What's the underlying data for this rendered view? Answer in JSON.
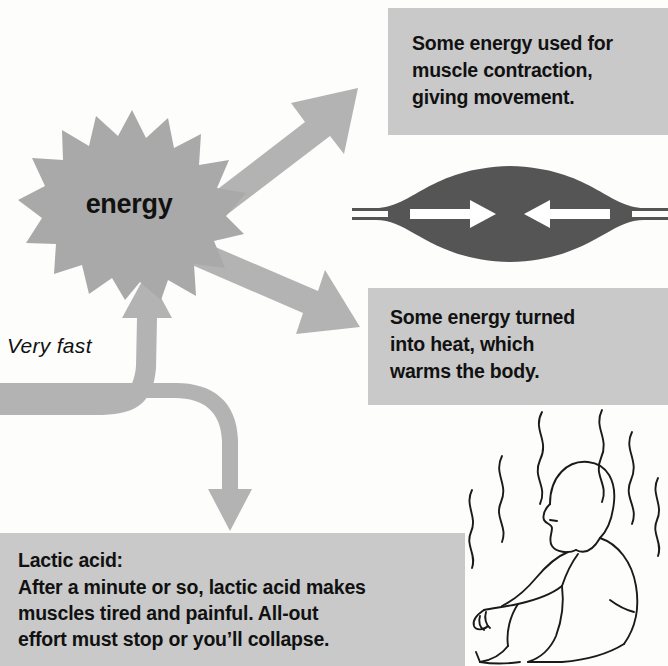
{
  "diagram": {
    "energy_node": {
      "label": "energy",
      "shape": "starburst"
    },
    "flow_label": {
      "text": "Very fast",
      "style": "italic"
    },
    "boxes": [
      {
        "id": "movement",
        "text": "Some energy used for muscle contraction, giving movement.",
        "lines": [
          "Some energy used for",
          "muscle contraction,",
          "giving movement."
        ]
      },
      {
        "id": "heat",
        "text": "Some energy turned into heat, which warms the body.",
        "lines": [
          "Some energy turned",
          "into heat, which",
          "warms the body."
        ]
      },
      {
        "id": "lactic",
        "heading": "Lactic acid:",
        "lines": [
          "After a minute or so, lactic acid makes",
          "muscles tired and painful. All-out",
          "effort must stop or you’ll collapse."
        ]
      }
    ],
    "illustrations": [
      {
        "id": "muscle",
        "caption": "contracting muscle with two inward arrows"
      },
      {
        "id": "tired-person",
        "caption": "seated exhausted person with heat waves"
      }
    ],
    "arrows": [
      {
        "id": "to-movement",
        "direction": "up-right",
        "from": "energy",
        "to": "movement-box"
      },
      {
        "id": "to-heat",
        "direction": "down-right",
        "from": "energy",
        "to": "heat-box"
      },
      {
        "id": "inflow-split",
        "direction": "right-then-split",
        "to": "energy and lactic-box"
      },
      {
        "id": "to-lactic",
        "direction": "down",
        "to": "lactic-box"
      }
    ],
    "colors": {
      "box_fill": "#c9c9c9",
      "burst_fill": "#a9a9a9",
      "arrow_fill": "#b3b3b3",
      "muscle_fill": "#555555",
      "text": "#111111",
      "page_background": "#fdfdfb",
      "line_art": "#1a1a1a"
    }
  }
}
